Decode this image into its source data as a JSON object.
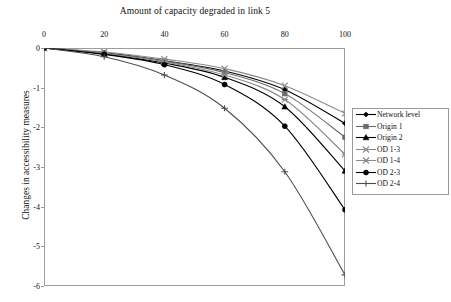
{
  "chart_data": {
    "type": "line",
    "title": "Amount of capacity degraded in link 5",
    "xlabel": "Amount of capacity degraded in link 5",
    "ylabel": "Changes in accessibility measures",
    "x": [
      0,
      20,
      40,
      60,
      80,
      100
    ],
    "xlim": [
      0,
      100
    ],
    "ylim": [
      -6,
      0
    ],
    "xticks": [
      "0",
      "20",
      "40",
      "60",
      "80",
      "100"
    ],
    "yticks": [
      "0",
      "-1",
      "-2",
      "-3",
      "-4",
      "-5",
      "-6"
    ],
    "grid": false,
    "legend_position": "right",
    "series": [
      {
        "name": "Network level",
        "marker": "diamond",
        "color": "#000000",
        "values": [
          0,
          -0.12,
          -0.32,
          -0.58,
          -1.05,
          -1.9
        ]
      },
      {
        "name": "Origin 1",
        "marker": "square",
        "color": "#6b6b6b",
        "values": [
          0,
          -0.13,
          -0.33,
          -0.62,
          -1.15,
          -2.25
        ]
      },
      {
        "name": "Origin 2",
        "marker": "triangle",
        "color": "#000000",
        "values": [
          0,
          -0.15,
          -0.38,
          -0.74,
          -1.48,
          -3.1
        ]
      },
      {
        "name": "OD 1-3",
        "marker": "cross-x",
        "color": "#8a8a8a",
        "values": [
          0,
          -0.1,
          -0.28,
          -0.52,
          -0.95,
          -1.65
        ]
      },
      {
        "name": "OD 1-4",
        "marker": "asterisk",
        "color": "#8a8a8a",
        "values": [
          0,
          -0.14,
          -0.35,
          -0.68,
          -1.3,
          -2.68
        ]
      },
      {
        "name": "OD 2-3",
        "marker": "circle",
        "color": "#000000",
        "values": [
          0,
          -0.16,
          -0.42,
          -0.92,
          -1.97,
          -4.08
        ]
      },
      {
        "name": "OD 2-4",
        "marker": "plus",
        "color": "#4d4d4d",
        "values": [
          0,
          -0.22,
          -0.68,
          -1.52,
          -3.12,
          -5.72
        ]
      }
    ]
  },
  "legend": {
    "items": [
      {
        "label": "Network level"
      },
      {
        "label": "Origin 1"
      },
      {
        "label": "Origin 2"
      },
      {
        "label": "OD 1-3"
      },
      {
        "label": "OD 1-4"
      },
      {
        "label": "OD 2-3"
      },
      {
        "label": "OD 2-4"
      }
    ]
  }
}
